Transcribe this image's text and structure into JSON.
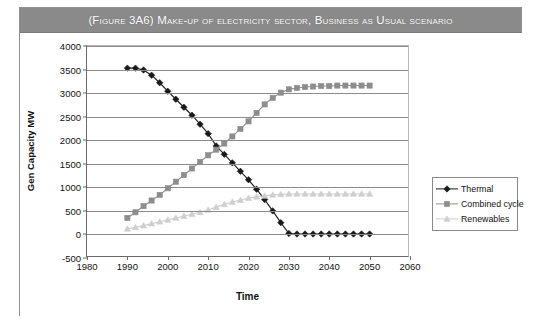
{
  "figure": {
    "title": "(Figure 3A6)  Make-up of electricity sector, Business as Usual scenario"
  },
  "legend": {
    "position": "right-middle",
    "entries": [
      {
        "label": "Thermal",
        "color": "#1a1a1a",
        "marker": "diamond"
      },
      {
        "label": "Combined cycle",
        "color": "#8d8d8d",
        "marker": "square"
      },
      {
        "label": "Renewables",
        "color": "#cfcfcf",
        "marker": "triangle"
      }
    ]
  },
  "chart_data": {
    "type": "line",
    "title": "(Figure 3A6)  Make-up of electricity sector, Business as Usual scenario",
    "xlabel": "Time",
    "ylabel": "Gen Capacity MW",
    "xlim": [
      1980,
      2060
    ],
    "ylim": [
      -500,
      4000
    ],
    "xticks": [
      1980,
      1990,
      2000,
      2010,
      2020,
      2030,
      2040,
      2050,
      2060
    ],
    "yticks": [
      -500,
      0,
      500,
      1000,
      1500,
      2000,
      2500,
      3000,
      3500,
      4000
    ],
    "grid": true,
    "x": [
      1990,
      1992,
      1994,
      1996,
      1998,
      2000,
      2002,
      2004,
      2006,
      2008,
      2010,
      2012,
      2014,
      2016,
      2018,
      2020,
      2022,
      2024,
      2026,
      2028,
      2030,
      2032,
      2034,
      2036,
      2038,
      2040,
      2042,
      2044,
      2046,
      2048,
      2050
    ],
    "series": [
      {
        "name": "Thermal",
        "color": "#1a1a1a",
        "marker": "diamond",
        "values": [
          3530,
          3530,
          3490,
          3380,
          3220,
          3040,
          2870,
          2700,
          2530,
          2340,
          2140,
          1880,
          1700,
          1520,
          1340,
          1160,
          960,
          740,
          500,
          250,
          20,
          10,
          10,
          10,
          10,
          10,
          10,
          10,
          10,
          10,
          10
        ]
      },
      {
        "name": "Combined cycle",
        "color": "#8d8d8d",
        "marker": "square",
        "values": [
          350,
          470,
          600,
          720,
          840,
          980,
          1120,
          1260,
          1400,
          1540,
          1680,
          1800,
          1930,
          2080,
          2240,
          2400,
          2580,
          2760,
          2900,
          3010,
          3080,
          3110,
          3130,
          3140,
          3150,
          3150,
          3160,
          3160,
          3160,
          3160,
          3160
        ]
      },
      {
        "name": "Renewables",
        "color": "#cfcfcf",
        "marker": "triangle",
        "values": [
          120,
          150,
          190,
          230,
          270,
          310,
          350,
          390,
          430,
          470,
          520,
          580,
          640,
          690,
          730,
          770,
          800,
          820,
          840,
          850,
          860,
          860,
          860,
          860,
          860,
          860,
          860,
          860,
          860,
          860,
          860
        ]
      }
    ]
  }
}
